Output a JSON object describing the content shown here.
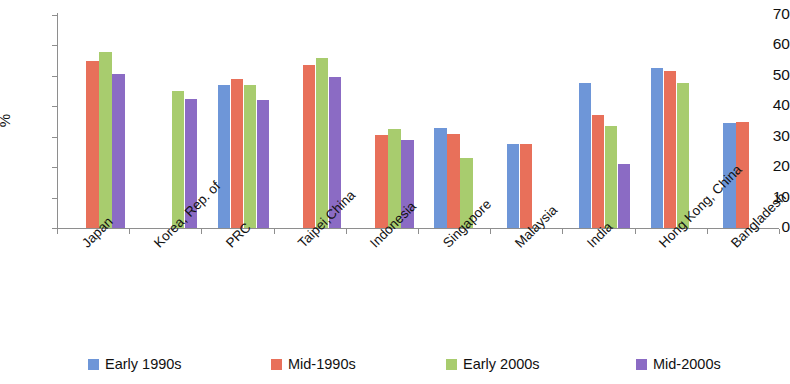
{
  "chart_data": {
    "type": "bar",
    "title": "",
    "xlabel": "",
    "ylabel": "%",
    "ylim": [
      0,
      70
    ],
    "ytick_values": [
      70,
      60,
      50,
      40,
      30,
      20,
      10,
      0
    ],
    "ytick_labels": [
      "70",
      "60",
      "50",
      "40",
      "30",
      "20",
      "10",
      "0"
    ],
    "grid": false,
    "legend_position": "bottom",
    "categories": [
      "Japan",
      "Korea, Rep. of",
      "PRC",
      "Taipei,China",
      "Indonesia",
      "Singapore",
      "Malaysia",
      "India",
      "Hong Kong, China",
      "Bangladesh"
    ],
    "series": [
      {
        "name": "Early 1990s",
        "color": "#6E96D8",
        "values": [
          null,
          null,
          47,
          null,
          null,
          33,
          27.5,
          47.5,
          52.5,
          34.5
        ]
      },
      {
        "name": "Mid-1990s",
        "color": "#E8705A",
        "values": [
          55,
          null,
          49,
          53.5,
          30.5,
          31,
          27.5,
          37,
          51.5,
          35
        ]
      },
      {
        "name": "Early 2000s",
        "color": "#A8CC6E",
        "values": [
          58,
          45,
          47,
          56,
          32.5,
          23,
          null,
          33.5,
          47.5,
          null
        ]
      },
      {
        "name": "Mid-2000s",
        "color": "#8B6BC4",
        "values": [
          50.5,
          42.5,
          42,
          49.5,
          29,
          null,
          null,
          21,
          null,
          null
        ]
      }
    ]
  },
  "legend": {
    "items": [
      {
        "label": "Early 1990s",
        "color": "#6E96D8"
      },
      {
        "label": "Mid-1990s",
        "color": "#E8705A"
      },
      {
        "label": "Early 2000s",
        "color": "#A8CC6E"
      },
      {
        "label": "Mid-2000s",
        "color": "#8B6BC4"
      }
    ]
  }
}
